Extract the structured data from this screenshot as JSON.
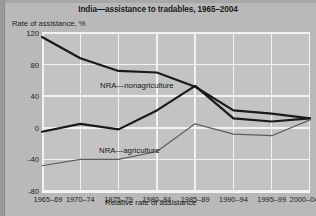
{
  "chart_data": {
    "type": "line",
    "title": "India—assistance to tradables, 1965–2004",
    "xlabel": "",
    "ylabel": "Rate of assistance, %",
    "ylim": [
      -80,
      120
    ],
    "yticks": [
      120,
      80,
      40,
      0,
      -40,
      -80
    ],
    "grid": true,
    "legend_position": "inline-annotations",
    "categories": [
      "1965–69",
      "1970–74",
      "1975–79",
      "1980–84",
      "1985–89",
      "1990–94",
      "1995–99",
      "2000–04"
    ],
    "series": [
      {
        "name": "NRA—nonagriculture",
        "color": "#1a1a1a",
        "values": [
          115,
          88,
          72,
          70,
          52,
          22,
          18,
          12
        ]
      },
      {
        "name": "NRA—agriculture",
        "color": "#1a1a1a",
        "values": [
          -5,
          5,
          -2,
          22,
          53,
          12,
          8,
          12
        ]
      },
      {
        "name": "Relative rate of assistance",
        "color": "#5e5e5e",
        "values": [
          -48,
          -40,
          -40,
          -30,
          5,
          -8,
          -10,
          10
        ]
      }
    ]
  },
  "figure": {
    "title": "India—assistance to tradables, 1965–2004",
    "y_axis_label": "Rate of assistance, %",
    "y_ticks": [
      "120",
      "80",
      "40",
      "0",
      "-40",
      "-80"
    ],
    "x_ticks": [
      "1965–69",
      "1970–74",
      "1975–79",
      "1980–84",
      "1985–89",
      "1990–94",
      "1995–99",
      "2000–04"
    ],
    "annotations": {
      "nonagriculture": "NRA—nonagriculture",
      "agriculture": "NRA—agriculture",
      "relative": "Relative rate of assistance"
    },
    "colors": {
      "background": "#b9b9b9",
      "plot_background": "#c3c3c3",
      "gridline": "#f2f2f2",
      "series_dark": "#1a1a1a",
      "series_gray": "#5e5e5e"
    }
  }
}
